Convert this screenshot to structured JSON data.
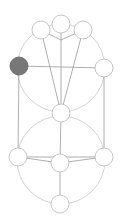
{
  "diagram": {
    "type": "graph",
    "colors": {
      "background": "#ffffff",
      "edge": "#9a9a9a",
      "ring": "#c8c8c8",
      "node_stroke": "#c0c0c0",
      "node_fill": "#ffffff",
      "highlight_fill": "#777777"
    },
    "rings": [
      {
        "id": "upper-ring",
        "cx": 61,
        "cy": 68,
        "r": 44
      },
      {
        "id": "lower-ring",
        "cx": 61,
        "cy": 160,
        "r": 44
      }
    ],
    "nodes": [
      {
        "id": "top-left",
        "x": 41,
        "y": 30,
        "r": 9,
        "filled": false
      },
      {
        "id": "top-center",
        "x": 61,
        "y": 24,
        "r": 9,
        "filled": false
      },
      {
        "id": "top-right",
        "x": 83,
        "y": 30,
        "r": 9,
        "filled": false
      },
      {
        "id": "mid-left",
        "x": 19,
        "y": 66,
        "r": 9,
        "filled": true
      },
      {
        "id": "mid-right",
        "x": 104,
        "y": 68,
        "r": 9,
        "filled": false
      },
      {
        "id": "center",
        "x": 61,
        "y": 113,
        "r": 9,
        "filled": false
      },
      {
        "id": "low-left",
        "x": 18,
        "y": 157,
        "r": 9,
        "filled": false
      },
      {
        "id": "low-center",
        "x": 60,
        "y": 163,
        "r": 9,
        "filled": false
      },
      {
        "id": "low-right",
        "x": 104,
        "y": 157,
        "r": 9,
        "filled": false
      },
      {
        "id": "bottom",
        "x": 60,
        "y": 204,
        "r": 9,
        "filled": false
      }
    ],
    "edges": [
      [
        "top-left",
        "center"
      ],
      [
        "top-center",
        "center"
      ],
      [
        "top-right",
        "center"
      ],
      [
        "top-left",
        "top-center-join"
      ],
      [
        "top-right",
        "top-center-join"
      ],
      [
        "mid-left",
        "mid-right"
      ],
      [
        "mid-left",
        "low-left"
      ],
      [
        "mid-right",
        "low-right"
      ],
      [
        "center",
        "low-center"
      ],
      [
        "low-left",
        "low-right"
      ],
      [
        "low-left",
        "low-center"
      ],
      [
        "low-right",
        "low-center"
      ],
      [
        "low-center",
        "bottom"
      ]
    ],
    "join_points": {
      "top-center-join": {
        "x": 61,
        "y": 40
      }
    }
  }
}
